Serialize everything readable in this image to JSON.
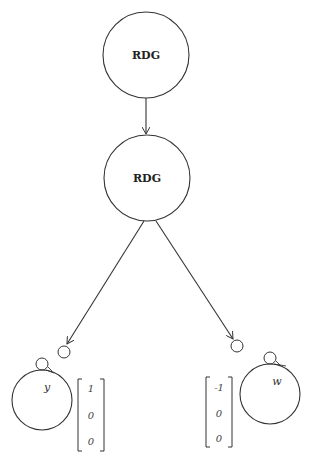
{
  "diagram": {
    "stroke_color": "#333333",
    "nodes": [
      {
        "id": "top",
        "label": "RDG"
      },
      {
        "id": "middle",
        "label": "RDG"
      }
    ],
    "leaves": [
      {
        "id": "left",
        "variable": "y",
        "vector": [
          "1",
          "0",
          "0"
        ]
      },
      {
        "id": "right",
        "variable": "w",
        "vector": [
          "-1",
          "0",
          "0"
        ]
      }
    ]
  }
}
